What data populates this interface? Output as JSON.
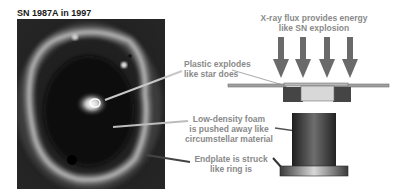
{
  "figure": {
    "photo_title": "SN 1987A in 1997",
    "photo_alt": "Hubble image of supernova 1987A ring",
    "top_caption": {
      "line1": "X-ray flux provides energy",
      "line2": "like SN explosion"
    },
    "labels": [
      {
        "id": "plastic",
        "line1": "Plastic explodes",
        "line2": "like star does"
      },
      {
        "id": "foam",
        "line1": "Low-density foam",
        "line2": "is pushed away like",
        "line3": "circumstellar material"
      },
      {
        "id": "endplate",
        "line1": "Endplate is struck",
        "line2": "like ring is"
      }
    ],
    "arrow_count": 4,
    "colors": {
      "label_text": "#8a8a8a",
      "arrow": "#6a6a6a",
      "target_dark": "#454545",
      "target_light": "#d8d8d8",
      "plate": "#9a9a9a",
      "leader_line_light": "#c8c8c8",
      "leader_line_dark": "#444444"
    }
  }
}
